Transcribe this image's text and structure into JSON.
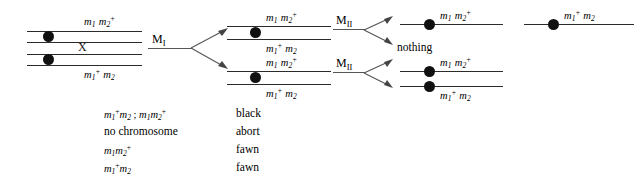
{
  "diagram": {
    "genotypes": {
      "m1_m2plus": "m1 m2+",
      "m1plus_m2": "m1+ m2"
    },
    "stage_labels": {
      "meiosis_one": "M",
      "meiosis_one_numeral": "I",
      "meiosis_two": "M",
      "meiosis_two_numeral": "II"
    },
    "crossover_mark": "X",
    "nothing_label": "nothing",
    "parent": {
      "top_label_m": "m",
      "top_label": "m1 m2+",
      "bottom_label": "m1+ m2"
    },
    "colors": {
      "line": "#2b2b2b",
      "centromere": "#111111",
      "arrow": "#555555",
      "text": "#000000"
    }
  },
  "legend": {
    "rows": [
      {
        "genotype": "m1+ m2 ; m1 m2+",
        "phenotype": "black"
      },
      {
        "genotype": "no chromosome",
        "phenotype": "abort"
      },
      {
        "genotype": "m1 m2+",
        "phenotype": "fawn"
      },
      {
        "genotype": "m1+ m2",
        "phenotype": "fawn"
      }
    ]
  }
}
